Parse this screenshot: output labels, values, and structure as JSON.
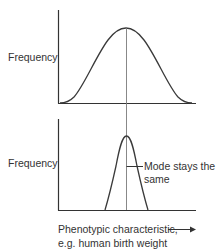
{
  "top_chart": {
    "ylabel": "Frequency",
    "curve": "wide-normal-distribution"
  },
  "bottom_chart": {
    "ylabel": "Frequency",
    "curve": "narrow-normal-distribution",
    "annotation": {
      "line1": "Mode stays the",
      "line2": "same"
    }
  },
  "xaxis": {
    "line1": "Phenotypic characteristic,",
    "line2": "e.g. human birth weight",
    "arrow": "right-arrow"
  },
  "colors": {
    "axis": "#333333",
    "curve": "#3a3a3a",
    "mode_line": "#7a7a7a",
    "text": "#333333"
  }
}
